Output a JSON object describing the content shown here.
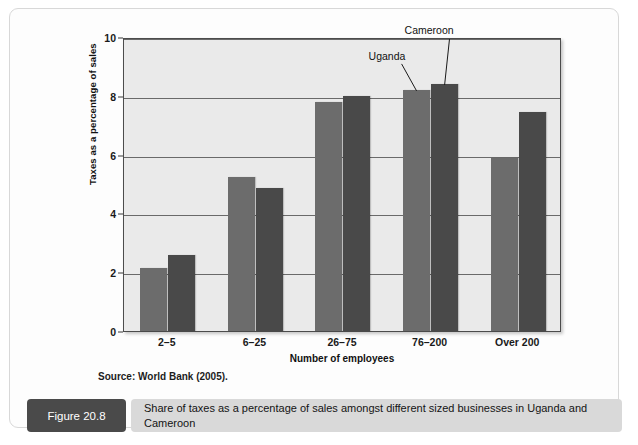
{
  "figure": {
    "number_label": "Figure 20.8",
    "caption": "Share of taxes as a percentage of sales amongst different sized businesses in Uganda and Cameroon",
    "source_note": "Source: World Bank (2005)."
  },
  "colors": {
    "uganda_bar": "#6c6c6c",
    "cameroon_bar": "#494949",
    "plot_background": "#eaeaea",
    "caption_box": "#4a4a4a",
    "caption_strip": "#d9d9d9"
  },
  "chart_data": {
    "type": "bar",
    "title": "",
    "xlabel": "Number of employees",
    "ylabel": "Taxes as a percentage of sales",
    "categories": [
      "2–5",
      "6–25",
      "26–75",
      "76–200",
      "Over 200"
    ],
    "series": [
      {
        "name": "Uganda",
        "values": [
          2.15,
          5.25,
          7.8,
          8.2,
          5.9
        ]
      },
      {
        "name": "Cameroon",
        "values": [
          2.6,
          4.85,
          8.0,
          8.4,
          7.45
        ]
      }
    ],
    "ylim": [
      0,
      10
    ],
    "yticks": [
      0,
      2,
      4,
      6,
      8,
      10
    ],
    "ytick_labels": [
      "0",
      "2",
      "4",
      "6",
      "8",
      "10"
    ],
    "grid": true,
    "legend_position": "annotated-on-bars",
    "annotations": [
      {
        "text": "Uganda",
        "target_group": 3,
        "target_series": 0
      },
      {
        "text": "Cameroon",
        "target_group": 3,
        "target_series": 1
      }
    ]
  }
}
